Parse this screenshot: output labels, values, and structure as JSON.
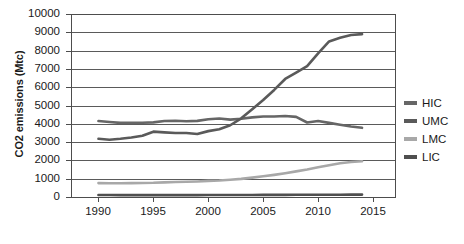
{
  "chart_data": {
    "type": "line",
    "title": "",
    "xlabel": "",
    "ylabel": "CO2 emissions (Mtc)",
    "xlim": [
      1987.5,
      2017
    ],
    "ylim": [
      0,
      10000
    ],
    "grid": true,
    "legend_position": "right",
    "x_ticks": [
      "1990",
      "1995",
      "2000",
      "2005",
      "2010",
      "2015"
    ],
    "x_tick_values": [
      1990,
      1995,
      2000,
      2005,
      2010,
      2015
    ],
    "y_ticks": [
      "0",
      "1000",
      "2000",
      "3000",
      "4000",
      "5000",
      "6000",
      "7000",
      "8000",
      "9000",
      "10000"
    ],
    "y_tick_values": [
      0,
      1000,
      2000,
      3000,
      4000,
      5000,
      6000,
      7000,
      8000,
      9000,
      10000
    ],
    "x": [
      1990,
      1991,
      1992,
      1993,
      1994,
      1995,
      1996,
      1997,
      1998,
      1999,
      2000,
      2001,
      2002,
      2003,
      2004,
      2005,
      2006,
      2007,
      2008,
      2009,
      2010,
      2011,
      2012,
      2013,
      2014
    ],
    "series": [
      {
        "name": "HIC",
        "color": "#666666",
        "values": [
          4150,
          4100,
          4050,
          4050,
          4060,
          4080,
          4150,
          4170,
          4140,
          4160,
          4250,
          4290,
          4230,
          4280,
          4350,
          4400,
          4400,
          4430,
          4380,
          4070,
          4150,
          4050,
          3950,
          3850,
          3780
        ]
      },
      {
        "name": "UMC",
        "color": "#5a5a5a",
        "values": [
          3180,
          3130,
          3180,
          3250,
          3350,
          3570,
          3530,
          3500,
          3500,
          3440,
          3600,
          3700,
          3920,
          4300,
          4800,
          5300,
          5850,
          6450,
          6800,
          7150,
          7850,
          8500,
          8700,
          8850,
          8900
        ]
      },
      {
        "name": "LMC",
        "color": "#a8a8a8",
        "values": [
          760,
          750,
          750,
          760,
          765,
          775,
          800,
          820,
          830,
          850,
          880,
          900,
          940,
          990,
          1060,
          1130,
          1210,
          1300,
          1400,
          1500,
          1620,
          1740,
          1840,
          1910,
          1950
        ]
      },
      {
        "name": "LIC",
        "color": "#4f4f4f",
        "values": [
          110,
          108,
          105,
          103,
          102,
          102,
          103,
          104,
          104,
          105,
          106,
          107,
          108,
          110,
          112,
          114,
          116,
          118,
          120,
          121,
          123,
          125,
          127,
          128,
          130
        ]
      }
    ]
  },
  "legend": {
    "items": [
      {
        "label": "HIC",
        "color": "#666666"
      },
      {
        "label": "UMC",
        "color": "#5a5a5a"
      },
      {
        "label": "LMC",
        "color": "#a8a8a8"
      },
      {
        "label": "LIC",
        "color": "#4f4f4f"
      }
    ]
  },
  "axes": {
    "y_title": "CO2 emissions (Mtc)"
  }
}
